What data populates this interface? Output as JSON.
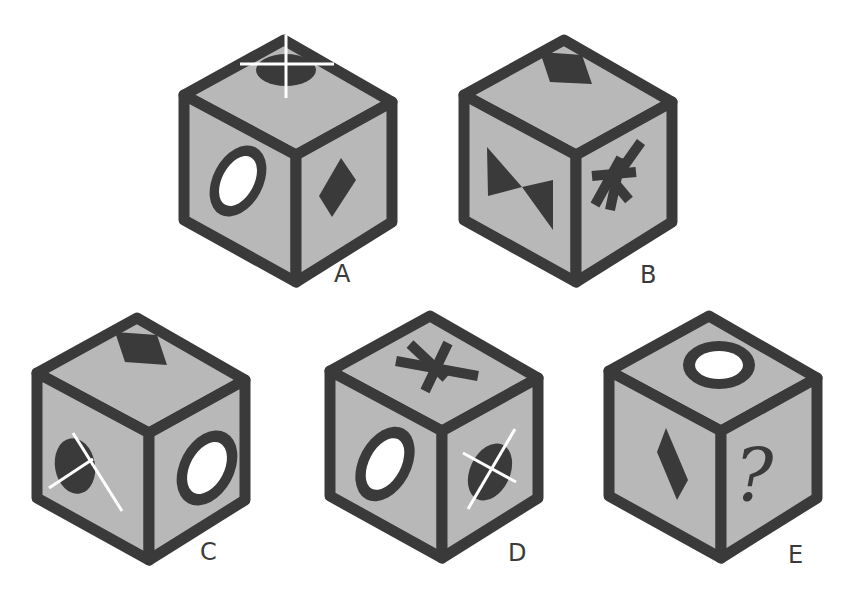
{
  "puzzle": {
    "description": "Cube sequence puzzle: five isometric cubes labeled A-E with symbols on visible faces; cube E has a question mark on its right face.",
    "colors": {
      "face_fill": "#b8b8b8",
      "edge": "#3a3a3a",
      "symbol_dark": "#3a3a3a",
      "symbol_light": "#ffffff",
      "background": "#ffffff"
    },
    "cubes": [
      {
        "label": "A",
        "faces": {
          "top": "dark ellipse with white cross",
          "left": "ring (white ellipse with dark outline)",
          "right": "dark diamond"
        }
      },
      {
        "label": "B",
        "faces": {
          "top": "dark diamond",
          "left": "bowtie (two dark triangles)",
          "right": "dark asterisk (three bars)"
        }
      },
      {
        "label": "C",
        "faces": {
          "top": "dark diamond",
          "left": "dark ellipse with white cross",
          "right": "ring (white ellipse with dark outline)"
        }
      },
      {
        "label": "D",
        "faces": {
          "top": "dark asterisk (three bars)",
          "left": "ring (white ellipse with dark outline)",
          "right": "dark ellipse with white cross"
        }
      },
      {
        "label": "E",
        "faces": {
          "top": "ring (white ellipse with dark outline)",
          "left": "dark diamond",
          "right": "?"
        }
      }
    ]
  }
}
